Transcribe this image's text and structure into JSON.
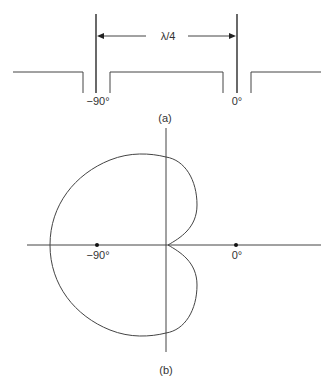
{
  "figure_a": {
    "spacing_label": "λ/4",
    "left_element_label": "−90°",
    "right_element_label": "0°",
    "caption": "(a)"
  },
  "figure_b": {
    "left_point_label": "−90°",
    "right_point_label": "0°",
    "caption": "(b)"
  },
  "colors": {
    "line": "#444444",
    "text": "#333333",
    "background": "#ffffff"
  }
}
